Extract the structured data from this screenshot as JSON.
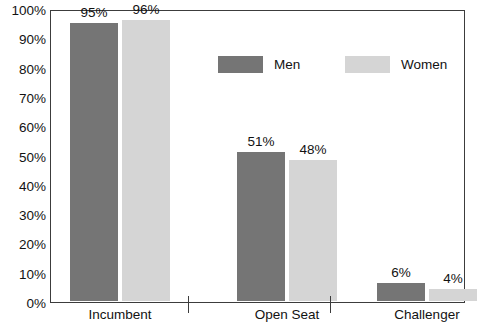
{
  "chart_data": {
    "type": "bar",
    "title": "",
    "subtitle": "",
    "xlabel": "",
    "ylabel": "",
    "ylim": [
      0,
      100
    ],
    "y_ticks": [
      "0%",
      "10%",
      "20%",
      "30%",
      "40%",
      "50%",
      "60%",
      "70%",
      "80%",
      "90%",
      "100%"
    ],
    "y_tick_values": [
      0,
      10,
      20,
      30,
      40,
      50,
      60,
      70,
      80,
      90,
      100
    ],
    "y_minor_tick_values": [
      5,
      15,
      25,
      35,
      45,
      55,
      65,
      75,
      85,
      95
    ],
    "grid": false,
    "legend_position": "inside-top-center",
    "categories": [
      "Incumbent",
      "Open Seat",
      "Challenger"
    ],
    "series": [
      {
        "name": "Men",
        "color": "#757575",
        "values": [
          95,
          51,
          6
        ],
        "labels": [
          "95%",
          "51%",
          "6%"
        ]
      },
      {
        "name": "Women",
        "color": "#d5d5d5",
        "values": [
          96,
          48,
          4
        ],
        "labels": [
          "96%",
          "48%",
          "4%"
        ]
      }
    ]
  },
  "legend": {
    "items": [
      {
        "label": "Men",
        "swatch": "men"
      },
      {
        "label": "Women",
        "swatch": "women"
      }
    ]
  },
  "axis": {
    "frame_color": "#3c3c3c",
    "label_color": "#121212"
  }
}
